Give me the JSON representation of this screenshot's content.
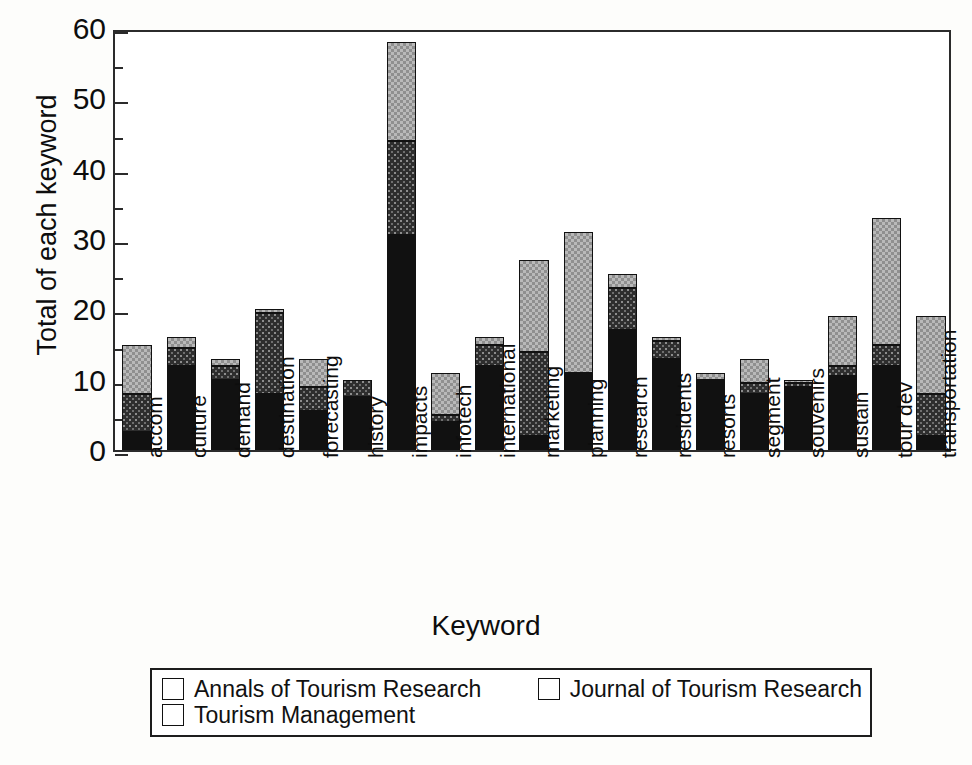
{
  "chart_data": {
    "type": "bar",
    "stacked": true,
    "title": "",
    "xlabel": "Keyword",
    "ylabel": "Total of each keyword",
    "ylim": [
      0,
      60
    ],
    "ytick_values": [
      0,
      10,
      20,
      30,
      40,
      50,
      60
    ],
    "ytick_labels": [
      "0",
      "10",
      "20",
      "30",
      "40",
      "50",
      "60"
    ],
    "yminor_step": 5,
    "grid": false,
    "legend_position": "below-axes",
    "categories": [
      "accom",
      "culture",
      "demand",
      "destination",
      "forecasting",
      "history",
      "impacts",
      "infotech",
      "international",
      "marketing",
      "planning",
      "research",
      "residents",
      "resorts",
      "segment",
      "souvenirs",
      "sustain",
      "tour dev",
      "transportation"
    ],
    "series": [
      {
        "name": "Annals of Tourism Research",
        "color": "#111111",
        "pattern": "solid-black",
        "values": [
          2.5,
          12,
          10,
          8,
          5.5,
          7.5,
          30.5,
          4,
          12,
          2,
          11,
          17,
          13,
          10,
          8,
          9,
          10.5,
          12,
          2
        ]
      },
      {
        "name": "Journal of Tourism Research",
        "color": "#2e2e2e",
        "pattern": "dark-speckle",
        "values": [
          5.5,
          2.5,
          2,
          11.5,
          3.5,
          2.5,
          13.5,
          1,
          3,
          12,
          0,
          6,
          2.5,
          0,
          1.5,
          0.5,
          1.5,
          3,
          6
        ]
      },
      {
        "name": "Tourism Management",
        "color": "#b9b9b9",
        "pattern": "light-checker",
        "values": [
          7,
          1.5,
          1,
          0.5,
          4,
          0,
          14,
          6,
          1,
          13,
          20,
          2,
          0.5,
          1,
          3.5,
          0.5,
          7,
          18,
          11
        ]
      }
    ],
    "totals": [
      15,
      16,
      13,
      20,
      13,
      10,
      58,
      11,
      16,
      27,
      31,
      25,
      16,
      11,
      13,
      10,
      19,
      33,
      19
    ]
  },
  "legend": {
    "entries": [
      {
        "label": "Annals of Tourism Research"
      },
      {
        "label": "Journal of Tourism Research"
      },
      {
        "label": "Tourism Management"
      }
    ]
  }
}
